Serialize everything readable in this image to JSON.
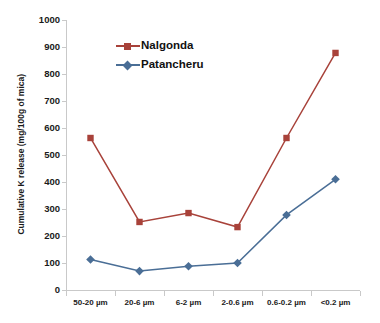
{
  "chart_data": {
    "type": "line",
    "title": "",
    "xlabel": "",
    "ylabel": "Cumulative K release (mg/100g of mica)",
    "categories": [
      "50-20 µm",
      "20-6 µm",
      "6-2 µm",
      "2-0.6 µm",
      "0.6-0.2 µm",
      "<0.2 µm"
    ],
    "ylim": [
      0,
      1000
    ],
    "y_ticks": [
      0,
      100,
      200,
      300,
      400,
      500,
      600,
      700,
      800,
      900,
      1000
    ],
    "y_tick_labels": [
      "0",
      "100",
      "200",
      "300",
      "400",
      "500",
      "600",
      "700",
      "800",
      "900",
      "1000"
    ],
    "grid": false,
    "legend_position": "upper-center-left",
    "series": [
      {
        "name": "Nalgonda",
        "color": "#A8423A",
        "marker": "square",
        "values": [
          563,
          252,
          285,
          233,
          563,
          878
        ]
      },
      {
        "name": "Patancheru",
        "color": "#4A6E96",
        "marker": "diamond",
        "values": [
          113,
          70,
          88,
          100,
          278,
          410
        ]
      }
    ]
  },
  "colors": {
    "nalgonda": "#A8423A",
    "patancheru": "#4A6E96",
    "axis": "#c9c9c9",
    "text": "#1a1a1a",
    "background": "#ffffff"
  }
}
